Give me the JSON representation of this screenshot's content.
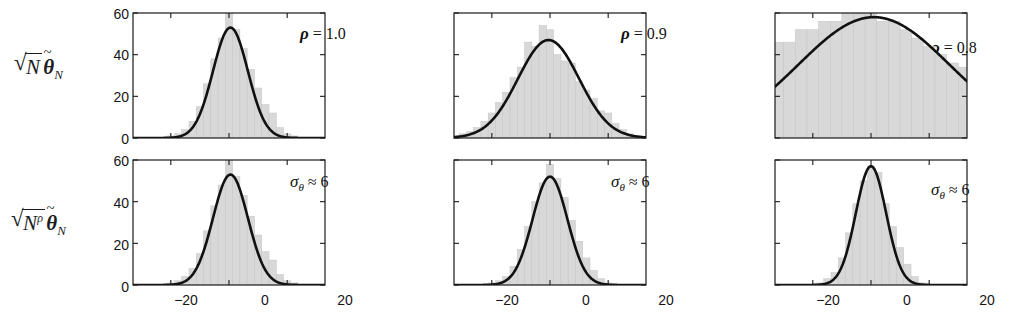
{
  "figure": {
    "row_labels": [
      {
        "name": "row-1-label",
        "sqrt_radicand": "N",
        "sqrt_exponent": "",
        "theta": "θ",
        "theta_sub": "N"
      },
      {
        "name": "row-2-label",
        "sqrt_radicand": "N",
        "sqrt_exponent": "ρ",
        "theta": "θ",
        "theta_sub": "N"
      }
    ],
    "y_ticks": [
      "60",
      "40",
      "20",
      "0"
    ],
    "y_tick_values": [
      60,
      40,
      20,
      0
    ],
    "x_ticks": [
      "−20",
      "0",
      "20"
    ],
    "x_tick_values": [
      -20,
      0,
      20
    ],
    "annotations": {
      "top": [
        {
          "symbol": "ρ",
          "relation": "=",
          "value": "1.0"
        },
        {
          "symbol": "ρ",
          "relation": "=",
          "value": "0.9"
        },
        {
          "symbol": "ρ",
          "relation": "=",
          "value": "0.8"
        }
      ],
      "bottom": [
        {
          "symbol": "σ",
          "symbol_sub": "θ",
          "relation": "≈",
          "value": "6"
        },
        {
          "symbol": "σ",
          "symbol_sub": "θ",
          "relation": "≈",
          "value": "6"
        },
        {
          "symbol": "σ",
          "symbol_sub": "θ",
          "relation": "≈",
          "value": "6"
        }
      ]
    },
    "colors": {
      "histogram_fill": "#d8d8d8",
      "histogram_edge": "#c4c4c4",
      "curve": "#111111",
      "axis": "#1a1a1a",
      "background": "#ffffff"
    }
  },
  "chart_data": [
    {
      "id": "panel-top-left",
      "type": "bar",
      "title": "",
      "annotation": "ρ = 1.0",
      "row": "sqrt(N) theta_N",
      "xlabel": "",
      "ylabel": "",
      "xlim": [
        -33,
        33
      ],
      "ylim": [
        0,
        60
      ],
      "grid": false,
      "legend": "none",
      "bin_width": 2.5,
      "categories": [
        -25,
        -22.5,
        -20,
        -17.5,
        -15,
        -12.5,
        -10,
        -7.5,
        -5,
        -2.5,
        0,
        2.5,
        5,
        7.5,
        10,
        12.5,
        15,
        17.5,
        20,
        22.5,
        25
      ],
      "values": [
        0,
        0,
        1,
        2,
        4,
        8,
        15,
        26,
        38,
        48,
        60,
        52,
        43,
        33,
        24,
        16,
        12,
        5,
        2,
        1,
        0
      ],
      "overlay_curve": {
        "type": "gaussian",
        "label": "normal fit",
        "mean": 0.5,
        "sigma": 6.0,
        "peak": 53
      }
    },
    {
      "id": "panel-top-middle",
      "type": "bar",
      "title": "",
      "annotation": "ρ = 0.9",
      "row": "sqrt(N) theta_N",
      "xlabel": "",
      "ylabel": "",
      "xlim": [
        -33,
        33
      ],
      "ylim": [
        0,
        60
      ],
      "grid": false,
      "legend": "none",
      "bin_width": 2.5,
      "categories": [
        -32.5,
        -30,
        -27.5,
        -25,
        -22.5,
        -20,
        -17.5,
        -15,
        -12.5,
        -10,
        -7.5,
        -5,
        -2.5,
        0,
        2.5,
        5,
        7.5,
        10,
        12.5,
        15,
        17.5,
        20,
        22.5,
        25,
        27.5,
        30
      ],
      "values": [
        1,
        2,
        3,
        5,
        8,
        12,
        17,
        22,
        29,
        34,
        46,
        44,
        54,
        52,
        40,
        37,
        36,
        27,
        23,
        19,
        13,
        12,
        7,
        4,
        2,
        1
      ],
      "overlay_curve": {
        "type": "gaussian",
        "label": "normal fit",
        "mean": -0.5,
        "sigma": 10.5,
        "peak": 47
      }
    },
    {
      "id": "panel-top-right",
      "type": "bar",
      "title": "",
      "annotation": "ρ = 0.8",
      "row": "sqrt(N) theta_N",
      "xlabel": "",
      "ylabel": "",
      "xlim": [
        -33,
        33
      ],
      "ylim": [
        0,
        60
      ],
      "grid": false,
      "legend": "none",
      "bin_width": 4,
      "categories": [
        -32,
        -28,
        -24,
        -20,
        -16,
        -12,
        -8,
        -4,
        0,
        4,
        8,
        12,
        16,
        20,
        24,
        28,
        32
      ],
      "values": [
        46,
        46,
        52,
        52,
        56,
        56,
        60,
        60,
        60,
        56,
        56,
        52,
        48,
        44,
        40,
        36,
        34
      ],
      "overlay_curve": {
        "type": "gaussian",
        "label": "normal fit",
        "mean": 1.0,
        "sigma": 26.0,
        "peak": 58
      }
    },
    {
      "id": "panel-bottom-left",
      "type": "bar",
      "title": "",
      "annotation": "σ_θ ≈ 6",
      "row": "sqrt(N^rho) theta_N",
      "xlabel": "",
      "ylabel": "",
      "xlim": [
        -33,
        33
      ],
      "ylim": [
        0,
        60
      ],
      "grid": false,
      "legend": "none",
      "bin_width": 2.5,
      "categories": [
        -25,
        -22.5,
        -20,
        -17.5,
        -15,
        -12.5,
        -10,
        -7.5,
        -5,
        -2.5,
        0,
        2.5,
        5,
        7.5,
        10,
        12.5,
        15,
        17.5,
        20,
        22.5,
        25
      ],
      "values": [
        0,
        0,
        1,
        2,
        4,
        8,
        15,
        26,
        38,
        48,
        60,
        52,
        43,
        33,
        24,
        16,
        12,
        5,
        2,
        1,
        0
      ],
      "overlay_curve": {
        "type": "gaussian",
        "label": "normal fit",
        "mean": 0.5,
        "sigma": 6.0,
        "peak": 53
      }
    },
    {
      "id": "panel-bottom-middle",
      "type": "bar",
      "title": "",
      "annotation": "σ_θ ≈ 6",
      "row": "sqrt(N^rho) theta_N",
      "xlabel": "",
      "ylabel": "",
      "xlim": [
        -33,
        33
      ],
      "ylim": [
        0,
        60
      ],
      "grid": false,
      "legend": "none",
      "bin_width": 2.5,
      "categories": [
        -22.5,
        -20,
        -17.5,
        -15,
        -12.5,
        -10,
        -7.5,
        -5,
        -2.5,
        0,
        2.5,
        5,
        7.5,
        10,
        12.5,
        15,
        17.5,
        20,
        22.5
      ],
      "values": [
        0,
        1,
        2,
        4,
        9,
        17,
        28,
        40,
        49,
        58,
        51,
        42,
        31,
        21,
        13,
        7,
        3,
        1,
        0
      ],
      "overlay_curve": {
        "type": "gaussian",
        "label": "normal fit",
        "mean": 0.0,
        "sigma": 6.0,
        "peak": 52
      }
    },
    {
      "id": "panel-bottom-right",
      "type": "bar",
      "title": "",
      "annotation": "σ_θ ≈ 6",
      "row": "sqrt(N^rho) theta_N",
      "xlabel": "",
      "ylabel": "",
      "xlim": [
        -33,
        33
      ],
      "ylim": [
        0,
        60
      ],
      "grid": false,
      "legend": "none",
      "bin_width": 2.5,
      "categories": [
        -20,
        -17.5,
        -15,
        -12.5,
        -10,
        -7.5,
        -5,
        -2.5,
        0,
        2.5,
        5,
        7.5,
        10,
        12.5,
        15,
        17.5,
        20
      ],
      "values": [
        0,
        1,
        3,
        6,
        13,
        25,
        39,
        50,
        57,
        54,
        39,
        28,
        18,
        10,
        4,
        1,
        0
      ],
      "overlay_curve": {
        "type": "gaussian",
        "label": "normal fit",
        "mean": 0.0,
        "sigma": 5.2,
        "peak": 57
      }
    }
  ]
}
